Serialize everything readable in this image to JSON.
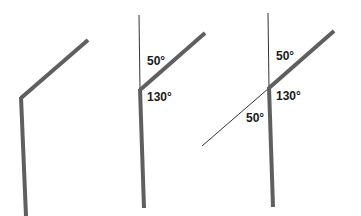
{
  "colors": {
    "thick_line": "#5f5f5f",
    "thin_line": "#333333",
    "label_text": "#1a1a1a",
    "background": "#ffffff"
  },
  "figures": [
    {
      "id": "figure-1",
      "description": "bent rod",
      "labels": []
    },
    {
      "id": "figure-2",
      "description": "bent rod with vertical reference line",
      "labels": [
        {
          "text": "50°"
        },
        {
          "text": "130°"
        }
      ]
    },
    {
      "id": "figure-3",
      "description": "bent rod with vertical reference and extended line",
      "labels": [
        {
          "text": "50°"
        },
        {
          "text": "130°"
        },
        {
          "text": "50°"
        }
      ]
    }
  ]
}
